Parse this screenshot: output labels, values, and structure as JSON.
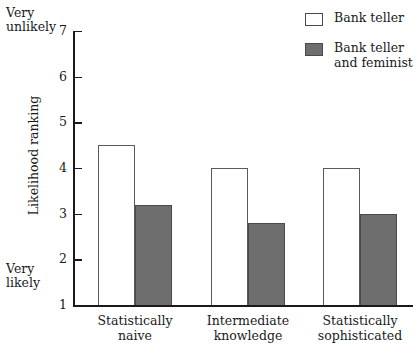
{
  "chart_data": {
    "type": "bar",
    "title": "",
    "xlabel": "",
    "ylabel": "Likelihood ranking",
    "ylim": [
      1,
      7
    ],
    "yticks": [
      "1",
      "2",
      "3",
      "4",
      "5",
      "6",
      "7"
    ],
    "grid": false,
    "legend_position": "top-right",
    "categories": [
      "Statistically\nnaive",
      "Intermediate\nknowledge",
      "Statistically\nsophisticated"
    ],
    "series": [
      {
        "name": "Bank teller",
        "values": [
          4.5,
          4.0,
          4.0
        ],
        "fill": "#ffffff"
      },
      {
        "name": "Bank teller\nand feminist",
        "values": [
          3.2,
          2.8,
          3.0
        ],
        "fill": "#6e6e6e"
      }
    ],
    "axis_anchors": {
      "top": "Very\nunlikely",
      "bottom": "Very\nlikely"
    }
  },
  "legend": {
    "items": [
      {
        "label": "Bank teller",
        "swatch": "open-square-swatch"
      },
      {
        "label": "Bank teller\nand feminist",
        "swatch": "filled-square-swatch"
      }
    ]
  },
  "colors": {
    "bar_fill_gray": "#6e6e6e",
    "bar_stroke": "#4a4a4a",
    "axis": "#1a1a1a",
    "background": "#ffffff",
    "text": "#1a1a1a"
  }
}
